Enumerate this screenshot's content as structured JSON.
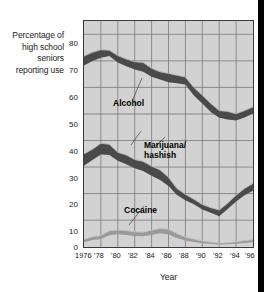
{
  "chart_data": {
    "type": "area",
    "title": "",
    "xlabel": "Year",
    "ylabel": "Percentage of high school seniors reporting use",
    "ylabel_lines": [
      "Percentage of",
      "high school",
      "seniors",
      "reporting use"
    ],
    "xlim": [
      1976,
      1996
    ],
    "ylim": [
      0,
      85
    ],
    "grid": true,
    "legend": "inline-annotations",
    "yticks": [
      0,
      10,
      20,
      30,
      40,
      50,
      60,
      70,
      80
    ],
    "ytick_labels": [
      "0",
      "10",
      "20",
      "30",
      "40",
      "50",
      "60",
      "70",
      "80"
    ],
    "xticks": [
      1976,
      1978,
      1980,
      1982,
      1984,
      1986,
      1988,
      1990,
      1992,
      1994,
      1996
    ],
    "xtick_labels": [
      "1976",
      "'78",
      "'80",
      "'82",
      "'84",
      "'86",
      "'88",
      "'90",
      "'92",
      "'94",
      "'96"
    ],
    "x": [
      1976,
      1977,
      1978,
      1979,
      1980,
      1981,
      1982,
      1983,
      1984,
      1985,
      1986,
      1987,
      1988,
      1989,
      1990,
      1991,
      1992,
      1993,
      1994,
      1995,
      1996
    ],
    "series": [
      {
        "name": "Alcohol",
        "label_lines": [
          "Alcohol"
        ],
        "color": "#4a4a4a",
        "edge_color": "#b9b9b9",
        "upper": [
          71.8,
          73.2,
          74.2,
          74.0,
          72.0,
          70.7,
          69.7,
          69.4,
          67.2,
          65.9,
          65.3,
          64.6,
          63.9,
          60.0,
          57.1,
          54.0,
          51.3,
          51.0,
          50.1,
          51.3,
          52.7
        ],
        "lower": [
          68.3,
          70.0,
          71.2,
          71.8,
          69.4,
          68.0,
          66.8,
          65.9,
          64.0,
          63.0,
          62.0,
          61.6,
          61.1,
          57.0,
          54.0,
          50.8,
          48.6,
          48.0,
          47.6,
          48.7,
          50.2
        ],
        "values": [
          70.0,
          71.6,
          72.7,
          72.9,
          70.7,
          69.4,
          68.2,
          67.6,
          65.6,
          64.4,
          63.6,
          63.1,
          62.5,
          58.5,
          55.6,
          52.4,
          50.0,
          49.5,
          48.9,
          50.0,
          51.5
        ]
      },
      {
        "name": "Marijuana/hashish",
        "label_lines": [
          "Marijuana/",
          "hashish"
        ],
        "color": "#4a4a4a",
        "edge_color": "#b9b9b9",
        "upper": [
          35.0,
          36.8,
          39.0,
          38.6,
          35.6,
          34.6,
          32.9,
          32.2,
          30.4,
          29.0,
          26.2,
          22.0,
          19.8,
          18.0,
          16.0,
          14.8,
          13.9,
          16.5,
          19.5,
          22.0,
          23.9
        ],
        "lower": [
          30.6,
          32.7,
          34.8,
          34.6,
          32.4,
          31.1,
          29.6,
          28.6,
          26.8,
          25.2,
          22.9,
          19.6,
          17.6,
          16.1,
          14.1,
          12.9,
          11.6,
          14.3,
          17.1,
          19.5,
          21.2
        ],
        "values": [
          32.8,
          34.8,
          36.9,
          36.6,
          34.0,
          32.9,
          31.3,
          30.4,
          28.6,
          27.1,
          24.6,
          20.8,
          18.7,
          17.1,
          15.1,
          13.9,
          12.8,
          15.4,
          18.3,
          20.8,
          22.6
        ]
      },
      {
        "name": "Cocaine",
        "label_lines": [
          "Cocaine"
        ],
        "color": "#9a9a9a",
        "edge_color": "#c4c4c4",
        "upper": [
          2.9,
          3.9,
          4.3,
          6.1,
          6.4,
          6.2,
          5.7,
          5.6,
          6.3,
          7.0,
          6.7,
          5.1,
          3.7,
          3.0,
          2.3,
          1.9,
          1.5,
          1.6,
          2.0,
          2.4,
          2.8
        ],
        "lower": [
          1.8,
          2.6,
          3.0,
          4.4,
          4.8,
          4.5,
          4.1,
          4.0,
          4.5,
          5.2,
          4.7,
          3.4,
          2.4,
          1.9,
          1.4,
          1.2,
          0.9,
          1.0,
          1.2,
          1.5,
          1.8
        ],
        "values": [
          2.3,
          3.2,
          3.6,
          5.2,
          5.6,
          5.3,
          4.9,
          4.8,
          5.4,
          6.1,
          5.7,
          4.2,
          3.0,
          2.4,
          1.8,
          1.5,
          1.2,
          1.3,
          1.6,
          1.9,
          2.3
        ]
      }
    ]
  },
  "annotations": [
    {
      "name": "alcohol",
      "lines": [
        "Alcohol"
      ]
    },
    {
      "name": "marijuana",
      "lines": [
        "Marijuana/",
        "hashish"
      ]
    },
    {
      "name": "cocaine",
      "lines": [
        "Cocaine"
      ]
    }
  ],
  "colors": {
    "plot_background": "#d2d2d2",
    "grid": "#6e6e6e",
    "axis": "#3a3a3a",
    "band_dark": "#4a4a4a",
    "band_light": "#9a9a9a",
    "text": "#1a1a1a",
    "right_bar": "#000000"
  }
}
